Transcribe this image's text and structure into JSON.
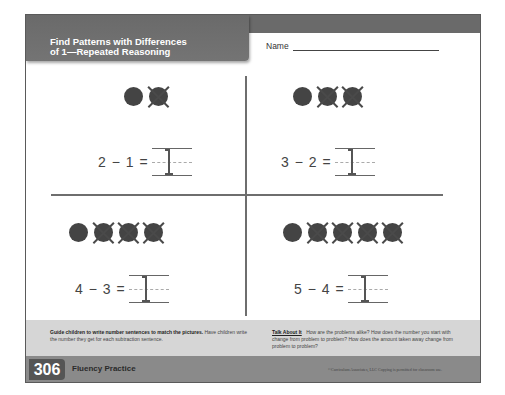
{
  "header": {
    "title_line1": "Find Patterns with Differences",
    "title_line2": "of 1—Repeated Reasoning",
    "name_label": "Name"
  },
  "problems": [
    {
      "expression": "2 − 1 =",
      "total_dots": 2,
      "crossed_out": 1,
      "answer": ""
    },
    {
      "expression": "3 − 2 =",
      "total_dots": 3,
      "crossed_out": 2,
      "answer": ""
    },
    {
      "expression": "4 − 3 =",
      "total_dots": 4,
      "crossed_out": 3,
      "answer": ""
    },
    {
      "expression": "5 − 4 =",
      "total_dots": 5,
      "crossed_out": 4,
      "answer": ""
    }
  ],
  "guide": {
    "instruction_bold": "Guide children to write number sentences to match the pictures.",
    "instruction_rest": " Have children write the number they get for each subtraction sentence.",
    "talk_label": "Talk About It",
    "talk_text": "How are the problems alike? How does the number you start with change from problem to problem? How does the amount taken away change from problem to problem?"
  },
  "footer": {
    "page_number": "306",
    "section_label": "Fluency Practice",
    "copyright": "©Curriculum Associates, LLC   Copying is permitted for classroom use."
  },
  "colors": {
    "header_band": "#6a6a6a",
    "guide_band": "#d6d6d6",
    "footer_band": "#8a8a8a",
    "dot": "#444444"
  }
}
